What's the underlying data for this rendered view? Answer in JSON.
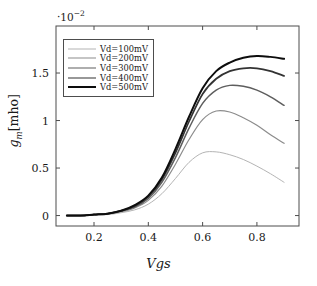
{
  "chart_data": {
    "type": "line",
    "title": "",
    "xlabel": "Vgs",
    "ylabel": "g_m[mho]",
    "y_multiplier": "·10⁻²",
    "y_multiplier_base": "·10",
    "y_multiplier_exponent": "−2",
    "xlim": [
      0.06,
      0.955
    ],
    "ylim": [
      -0.11,
      1.995
    ],
    "xticks": [
      0.2,
      0.4,
      0.6,
      0.8
    ],
    "xticklabels": [
      "0.2",
      "0.4",
      "0.6",
      "0.8"
    ],
    "yticks": [
      0,
      0.5,
      1,
      1.5
    ],
    "yticklabels": [
      "0",
      "0.5",
      "1",
      "1.5"
    ],
    "grid": false,
    "legend_position": "upper-left",
    "x": [
      0.1,
      0.15,
      0.2,
      0.25,
      0.3,
      0.35,
      0.4,
      0.45,
      0.5,
      0.55,
      0.6,
      0.65,
      0.7,
      0.75,
      0.8,
      0.85,
      0.9
    ],
    "series": [
      {
        "name": "Vd=100mV",
        "color": "#b4b4b4",
        "width": 1.0,
        "values": [
          0.0,
          0.0,
          0.01,
          0.01,
          0.03,
          0.06,
          0.12,
          0.23,
          0.39,
          0.56,
          0.66,
          0.67,
          0.64,
          0.59,
          0.52,
          0.44,
          0.35
        ],
        "peak_x": 0.58,
        "peak_y": 0.67
      },
      {
        "name": "Vd=200mV",
        "color": "#8c8c8c",
        "width": 1.2,
        "values": [
          0.0,
          0.0,
          0.01,
          0.02,
          0.04,
          0.08,
          0.16,
          0.31,
          0.54,
          0.8,
          1.01,
          1.1,
          1.09,
          1.03,
          0.95,
          0.85,
          0.76
        ],
        "peak_x": 0.66,
        "peak_y": 1.1
      },
      {
        "name": "Vd=300mV",
        "color": "#5e5e5e",
        "width": 1.5,
        "values": [
          0.0,
          0.0,
          0.01,
          0.02,
          0.05,
          0.09,
          0.18,
          0.35,
          0.61,
          0.92,
          1.18,
          1.32,
          1.37,
          1.36,
          1.32,
          1.25,
          1.16
        ],
        "peak_x": 0.73,
        "peak_y": 1.37
      },
      {
        "name": "Vd=400mV",
        "color": "#333333",
        "width": 1.7,
        "values": [
          0.0,
          0.0,
          0.01,
          0.02,
          0.05,
          0.1,
          0.2,
          0.38,
          0.66,
          0.99,
          1.28,
          1.44,
          1.52,
          1.55,
          1.55,
          1.52,
          1.47
        ],
        "peak_x": 0.79,
        "peak_y": 1.55
      },
      {
        "name": "Vd=500mV",
        "color": "#0d0d0d",
        "width": 2.0,
        "values": [
          0.0,
          0.0,
          0.01,
          0.02,
          0.05,
          0.11,
          0.21,
          0.4,
          0.7,
          1.04,
          1.34,
          1.52,
          1.61,
          1.66,
          1.68,
          1.67,
          1.65
        ],
        "peak_x": 0.83,
        "peak_y": 1.68
      }
    ]
  },
  "legend": {
    "items": [
      {
        "label": "Vd=100mV"
      },
      {
        "label": "Vd=200mV"
      },
      {
        "label": "Vd=300mV"
      },
      {
        "label": "Vd=400mV"
      },
      {
        "label": "Vd=500mV"
      }
    ]
  },
  "axes": {
    "x_title": "Vgs",
    "y_title_base": "g",
    "y_title_sub": "m",
    "y_title_unit": "[mho]"
  }
}
